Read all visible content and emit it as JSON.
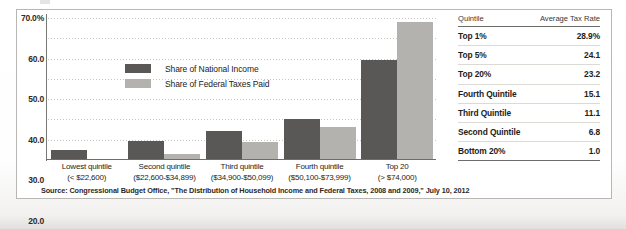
{
  "chart_data": {
    "type": "bar",
    "title": "",
    "xlabel": "",
    "ylabel": "",
    "ylim": [
      0,
      70
    ],
    "yticks": [
      "70.0%",
      "60.0",
      "50.0",
      "40.0",
      "30.0",
      "20.0",
      "10.0",
      "0.0"
    ],
    "ytick_values": [
      70,
      60,
      50,
      40,
      30,
      20,
      10,
      0
    ],
    "grid": true,
    "legend_position": "upper-center",
    "categories": [
      "Lowest quintile",
      "Second quintile",
      "Third quintile",
      "Fourth quintile",
      "Top 20"
    ],
    "category_sublabels": [
      "(< $22,600)",
      "($22,600-$34,899)",
      "($34,900-$50,099)",
      "($50,100-$73,999)",
      "(> $74,000)"
    ],
    "series": [
      {
        "name": "Share of National Income",
        "color": "#5a5856",
        "values": [
          5.1,
          9.5,
          14.1,
          20.1,
          49.5
        ]
      },
      {
        "name": "Share of Federal Taxes Paid",
        "color": "#b4b2ae",
        "values": [
          0.3,
          3.2,
          8.9,
          16.5,
          68.2
        ]
      }
    ],
    "annotations": [
      {
        "label": "0.3%",
        "series": "Share of Federal Taxes Paid",
        "category": "Lowest quintile"
      }
    ]
  },
  "legend": {
    "items": [
      {
        "label": "Share of National Income",
        "color": "#5a5856"
      },
      {
        "label": "Share of Federal Taxes Paid",
        "color": "#b4b2ae"
      }
    ]
  },
  "source_note": "Source: Congressional Budget Office, \"The Distribution of Household Income and Federal Taxes, 2008 and 2009,\" July 10, 2012",
  "table": {
    "columns": [
      "Quintile",
      "Average Tax Rate"
    ],
    "rows": [
      {
        "quintile": "Top 1%",
        "rate": "28.9%"
      },
      {
        "quintile": "Top 5%",
        "rate": "24.1"
      },
      {
        "quintile": "Top 20%",
        "rate": "23.2"
      },
      {
        "quintile": "Fourth Quintile",
        "rate": "15.1"
      },
      {
        "quintile": "Third Quintile",
        "rate": "11.1"
      },
      {
        "quintile": "Second Quintile",
        "rate": "6.8"
      },
      {
        "quintile": "Bottom 20%",
        "rate": "1.0"
      }
    ]
  }
}
